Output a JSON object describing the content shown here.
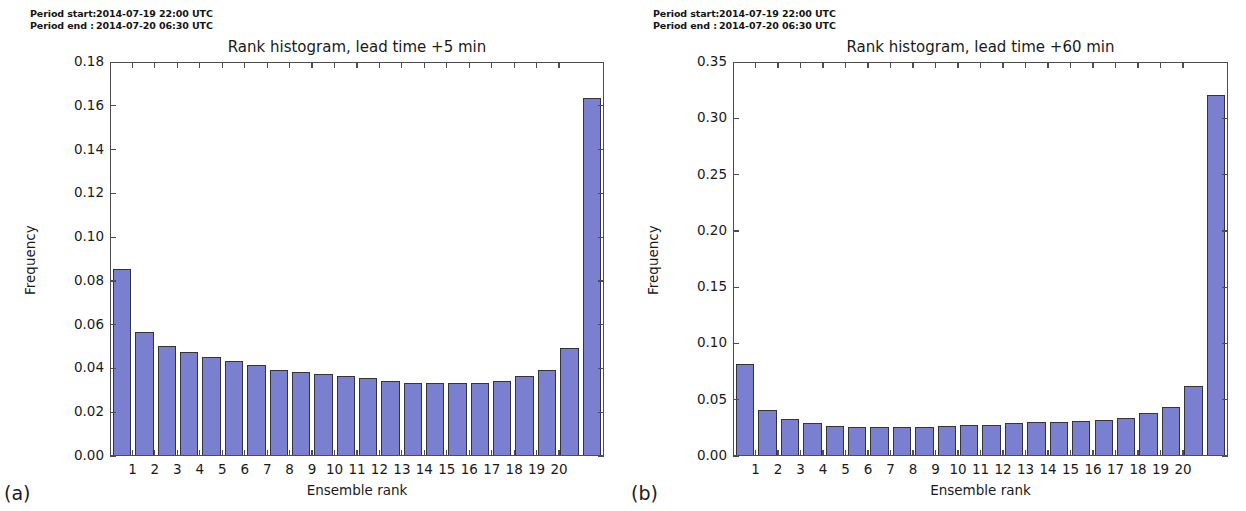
{
  "figure": {
    "panels": [
      {
        "id": "a",
        "subfigure_label": "(a)",
        "period_start_key": "Period start:",
        "period_start_value": "2014-07-19 22:00 UTC",
        "period_end_key": "Period end :",
        "period_end_value": "2014-07-20 06:30 UTC",
        "chart_data": {
          "type": "bar",
          "title": "Rank histogram, lead time +5 min",
          "xlabel": "Ensemble rank",
          "ylabel": "Frequency",
          "ylim": [
            0.0,
            0.18
          ],
          "ytick_labels": [
            "0.00",
            "0.02",
            "0.04",
            "0.06",
            "0.08",
            "0.10",
            "0.12",
            "0.14",
            "0.16",
            "0.18"
          ],
          "ytick_values": [
            0.0,
            0.02,
            0.04,
            0.06,
            0.08,
            0.1,
            0.12,
            0.14,
            0.16,
            0.18
          ],
          "xtick_labels": [
            "1",
            "2",
            "3",
            "4",
            "5",
            "6",
            "7",
            "8",
            "9",
            "10",
            "11",
            "12",
            "13",
            "14",
            "15",
            "16",
            "17",
            "18",
            "19",
            "20"
          ],
          "grid": false,
          "legend": null,
          "bar_color": "#7b7fcf",
          "bar_edge_color": "#33333b",
          "n_bars": 21,
          "values": [
            0.085,
            0.056,
            0.05,
            0.047,
            0.045,
            0.043,
            0.041,
            0.039,
            0.038,
            0.037,
            0.036,
            0.035,
            0.034,
            0.033,
            0.033,
            0.033,
            0.033,
            0.034,
            0.036,
            0.039,
            0.049,
            0.163
          ]
        }
      },
      {
        "id": "b",
        "subfigure_label": "(b)",
        "period_start_key": "Period start:",
        "period_start_value": "2014-07-19 22:00 UTC",
        "period_end_key": "Period end :",
        "period_end_value": "2014-07-20 06:30 UTC",
        "chart_data": {
          "type": "bar",
          "title": "Rank histogram, lead time +60 min",
          "xlabel": "Ensemble rank",
          "ylabel": "Frequency",
          "ylim": [
            0.0,
            0.35
          ],
          "ytick_labels": [
            "0.00",
            "0.05",
            "0.10",
            "0.15",
            "0.20",
            "0.25",
            "0.30",
            "0.35"
          ],
          "ytick_values": [
            0.0,
            0.05,
            0.1,
            0.15,
            0.2,
            0.25,
            0.3,
            0.35
          ],
          "xtick_labels": [
            "1",
            "2",
            "3",
            "4",
            "5",
            "6",
            "7",
            "8",
            "9",
            "10",
            "11",
            "12",
            "13",
            "14",
            "15",
            "16",
            "17",
            "18",
            "19",
            "20"
          ],
          "grid": false,
          "legend": null,
          "bar_color": "#7b7fcf",
          "bar_edge_color": "#33333b",
          "n_bars": 21,
          "values": [
            0.081,
            0.04,
            0.032,
            0.028,
            0.026,
            0.025,
            0.025,
            0.025,
            0.025,
            0.026,
            0.027,
            0.027,
            0.028,
            0.029,
            0.029,
            0.03,
            0.031,
            0.033,
            0.037,
            0.043,
            0.061,
            0.32
          ]
        }
      }
    ]
  }
}
